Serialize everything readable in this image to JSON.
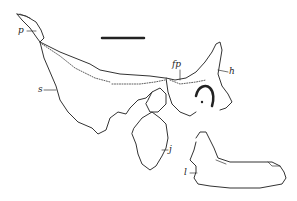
{
  "figure": {
    "type": "anatomical line drawing",
    "scale_bar": true,
    "labels": [
      {
        "id": "p",
        "text": "p"
      },
      {
        "id": "s",
        "text": "s"
      },
      {
        "id": "fp",
        "text": "fp"
      },
      {
        "id": "h",
        "text": "h"
      },
      {
        "id": "j",
        "text": "j"
      },
      {
        "id": "l",
        "text": "l"
      }
    ],
    "line_color": "#333333",
    "background": "#ffffff"
  }
}
